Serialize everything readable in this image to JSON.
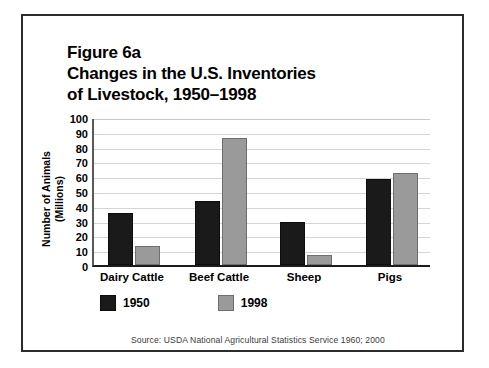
{
  "figure": {
    "title_lines": [
      "Figure 6a",
      "Changes in the U.S. Inventories",
      "of Livestock, 1950–1998"
    ],
    "source": "Source: USDA National Agricultural Statistics Service 1960; 2000"
  },
  "colors": {
    "series_1950": "#1a1a1a",
    "series_1998": "#9a9a9a",
    "gridline": "#d5d5d5",
    "axis": "#1c1c1c",
    "frame": "#2b2b2b",
    "text": "#000000",
    "source_text": "#3d3d3d"
  },
  "chart_data": {
    "type": "bar",
    "title": "Figure 6a Changes in the U.S. Inventories of Livestock, 1950–1998",
    "subtitle": "",
    "xlabel": "",
    "ylabel_lines": [
      "Number of Animals",
      "(Millions)"
    ],
    "ylabel": "Number of Animals (Millions)",
    "categories": [
      "Dairy Cattle",
      "Beef Cattle",
      "Sheep",
      "Pigs"
    ],
    "series": [
      {
        "name": "1950",
        "color": "#1a1a1a",
        "values": [
          35,
          43,
          29,
          58
        ]
      },
      {
        "name": "1998",
        "color": "#9a9a9a",
        "values": [
          13,
          86,
          7,
          62
        ]
      }
    ],
    "ylim": [
      0,
      100
    ],
    "yticks": [
      0,
      10,
      20,
      30,
      40,
      50,
      60,
      70,
      80,
      90,
      100
    ],
    "ytick_labels": [
      "0",
      "10",
      "20",
      "30",
      "40",
      "50",
      "60",
      "70",
      "80",
      "90",
      "100"
    ],
    "grid": true,
    "grid_axis": "y",
    "legend": [
      "1950",
      "1998"
    ],
    "legend_position": "below-axis-left",
    "units": "millions of animals",
    "source": "USDA National Agricultural Statistics Service 1960; 2000"
  }
}
